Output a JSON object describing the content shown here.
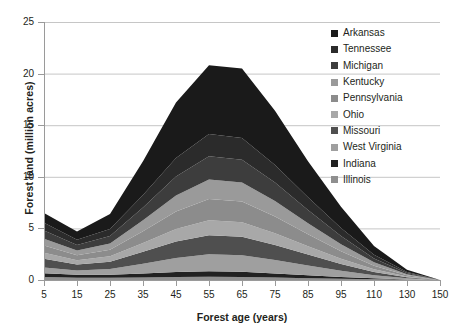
{
  "axes": {
    "x_title": "Forest age (years)",
    "y_title": "Forest land (million acres)",
    "x_ticks": [
      "5",
      "15",
      "25",
      "35",
      "45",
      "55",
      "65",
      "75",
      "85",
      "95",
      "110",
      "130",
      "150"
    ],
    "y_ticks": [
      "0",
      "5",
      "10",
      "15",
      "20",
      "25"
    ]
  },
  "legend": {
    "items": [
      {
        "label": "Arkansas",
        "color": "#1a1a1a"
      },
      {
        "label": "Tennessee",
        "color": "#2b2b2b"
      },
      {
        "label": "Michigan",
        "color": "#3d3d3d"
      },
      {
        "label": "Kentucky",
        "color": "#9a9a9a"
      },
      {
        "label": "Pennsylvania",
        "color": "#8c8c8c"
      },
      {
        "label": "Ohio",
        "color": "#a8a8a8"
      },
      {
        "label": "Missouri",
        "color": "#4f4f4f"
      },
      {
        "label": "West Virginia",
        "color": "#9f9f9f"
      },
      {
        "label": "Indiana",
        "color": "#212121"
      },
      {
        "label": "Illinois",
        "color": "#8f8f8f"
      }
    ]
  },
  "chart_data": {
    "type": "area",
    "stacked": true,
    "title": "",
    "xlabel": "Forest age (years)",
    "ylabel": "Forest land (million acres)",
    "xlim": [
      5,
      150
    ],
    "ylim": [
      0,
      25
    ],
    "grid": "horizontal",
    "legend_position": "top-right",
    "x": [
      5,
      15,
      25,
      35,
      45,
      55,
      65,
      75,
      85,
      95,
      110,
      130,
      150
    ],
    "series": [
      {
        "name": "Illinois",
        "color": "#8f8f8f",
        "values": [
          0.3,
          0.22,
          0.22,
          0.25,
          0.3,
          0.32,
          0.3,
          0.24,
          0.18,
          0.12,
          0.07,
          0.03,
          0.0
        ]
      },
      {
        "name": "Indiana",
        "color": "#212121",
        "values": [
          0.35,
          0.28,
          0.3,
          0.38,
          0.48,
          0.52,
          0.5,
          0.4,
          0.28,
          0.18,
          0.09,
          0.03,
          0.0
        ]
      },
      {
        "name": "West Virginia",
        "color": "#9f9f9f",
        "values": [
          0.55,
          0.42,
          0.55,
          0.95,
          1.35,
          1.65,
          1.6,
          1.3,
          0.95,
          0.6,
          0.3,
          0.1,
          0.0
        ]
      },
      {
        "name": "Missouri",
        "color": "#4f4f4f",
        "values": [
          0.85,
          0.58,
          0.7,
          1.15,
          1.6,
          1.85,
          1.8,
          1.45,
          1.05,
          0.65,
          0.32,
          0.1,
          0.0
        ]
      },
      {
        "name": "Ohio",
        "color": "#a8a8a8",
        "values": [
          0.6,
          0.42,
          0.52,
          0.85,
          1.2,
          1.45,
          1.4,
          1.15,
          0.82,
          0.52,
          0.25,
          0.08,
          0.0
        ]
      },
      {
        "name": "Pennsylvania",
        "color": "#8c8c8c",
        "values": [
          0.7,
          0.48,
          0.65,
          1.15,
          1.7,
          2.05,
          2.0,
          1.62,
          1.15,
          0.72,
          0.35,
          0.11,
          0.0
        ]
      },
      {
        "name": "Kentucky",
        "color": "#9a9a9a",
        "values": [
          0.65,
          0.45,
          0.6,
          1.05,
          1.55,
          1.9,
          1.85,
          1.5,
          1.08,
          0.68,
          0.33,
          0.1,
          0.0
        ]
      },
      {
        "name": "Michigan",
        "color": "#3d3d3d",
        "values": [
          0.8,
          0.55,
          0.72,
          1.25,
          1.85,
          2.25,
          2.2,
          1.78,
          1.28,
          0.8,
          0.38,
          0.12,
          0.0
        ]
      },
      {
        "name": "Tennessee",
        "color": "#2b2b2b",
        "values": [
          0.75,
          0.5,
          0.68,
          1.2,
          1.78,
          2.15,
          2.1,
          1.7,
          1.22,
          0.76,
          0.36,
          0.11,
          0.0
        ]
      },
      {
        "name": "Arkansas",
        "color": "#1a1a1a",
        "values": [
          0.95,
          0.8,
          1.46,
          3.27,
          5.39,
          6.66,
          6.75,
          5.26,
          3.49,
          2.07,
          0.85,
          0.22,
          0.0
        ]
      }
    ],
    "totals": [
      6.5,
      4.7,
      6.4,
      11.5,
      17.2,
      20.8,
      20.5,
      16.4,
      11.5,
      7.1,
      3.3,
      1.0,
      0.0
    ]
  }
}
